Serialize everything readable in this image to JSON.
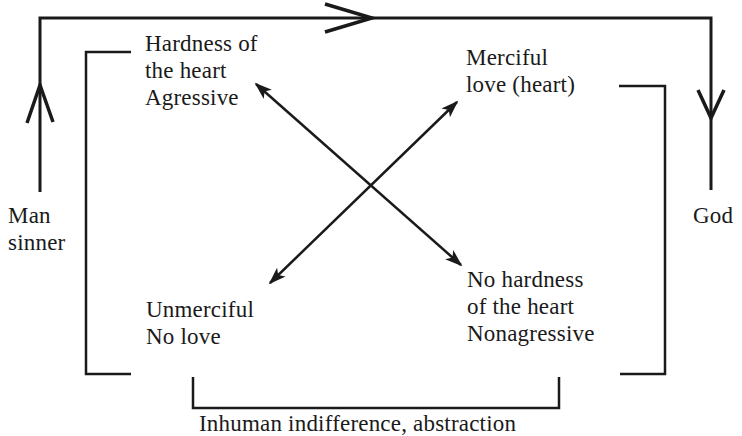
{
  "diagram": {
    "top_caption_clipped": "",
    "labels": {
      "top_left": [
        "Hardness of",
        "the heart",
        "Agressive"
      ],
      "top_right": [
        "Merciful",
        "love (heart)"
      ],
      "bottom_left": [
        "Unmerciful",
        "No love"
      ],
      "bottom_right": [
        "No hardness",
        "of the heart",
        "Nonagressive"
      ],
      "left_side": [
        "Man",
        "sinner"
      ],
      "right_side": [
        "God"
      ],
      "bottom": "Inhuman indifference, abstraction"
    },
    "connections": [
      {
        "from": "left_side",
        "to": "right_side",
        "type": "path-arrow",
        "note": "up, across top, down"
      },
      {
        "from": "top_left",
        "to": "bottom_right",
        "type": "double-arrow"
      },
      {
        "from": "bottom_left",
        "to": "top_right",
        "type": "double-arrow"
      }
    ],
    "colors": {
      "ink": "#1a1a1a",
      "background": "#ffffff"
    }
  }
}
